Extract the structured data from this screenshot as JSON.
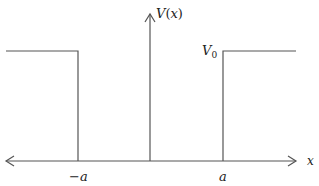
{
  "diagram": {
    "type": "finite potential well (step potential)",
    "colors": {
      "background": "#ffffff",
      "line": "#555555",
      "text": "#222222"
    },
    "axes": {
      "x_label": "x",
      "y_label_func": "V",
      "y_label_open": "(",
      "y_label_var": "x",
      "y_label_close": ")"
    },
    "levels": {
      "v0_label_main": "V",
      "v0_label_sub": "0"
    },
    "ticks": {
      "neg_a_sign": "−",
      "neg_a_var": "a",
      "pos_a": "a"
    }
  }
}
